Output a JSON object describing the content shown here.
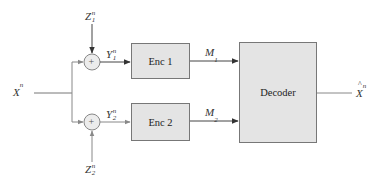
{
  "diagram": {
    "title": "",
    "input": {
      "symbol": "X",
      "sup": "n"
    },
    "noise": [
      {
        "symbol": "Z",
        "sub": "1",
        "sup": "n"
      },
      {
        "symbol": "Z",
        "sub": "2",
        "sup": "n"
      }
    ],
    "adders": [
      {
        "glyph": "+"
      },
      {
        "glyph": "+"
      }
    ],
    "observations": [
      {
        "symbol": "Y",
        "sub": "1",
        "sup": "n"
      },
      {
        "symbol": "Y",
        "sub": "2",
        "sup": "n"
      }
    ],
    "encoders": [
      {
        "label": "Enc 1"
      },
      {
        "label": "Enc 2"
      }
    ],
    "messages": [
      {
        "symbol": "M",
        "sub": "1"
      },
      {
        "symbol": "M",
        "sub": "2"
      }
    ],
    "decoder": {
      "label": "Decoder"
    },
    "output": {
      "symbol": "X",
      "sup": "n",
      "accent": "hat"
    },
    "colors": {
      "block_fill": "#e4e4e4",
      "block_border": "#777777",
      "line": "#666666",
      "adder_fill": "#ececec"
    }
  }
}
